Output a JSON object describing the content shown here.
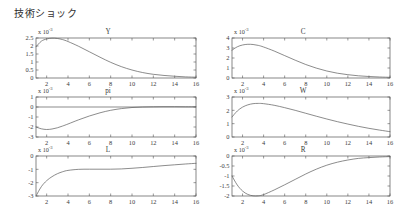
{
  "figure": {
    "title": "技術ショック",
    "width": 400,
    "height": 220,
    "line_color": "#5a5a5a",
    "axis_color": "#555555",
    "background": "#ffffff",
    "scale_annotation": "x 10",
    "scale_exponent": "-3"
  },
  "chart_data": [
    {
      "type": "line",
      "title": "Y",
      "xlabel": "",
      "ylabel": "",
      "xlim": [
        1,
        16
      ],
      "ylim": [
        0,
        2.5
      ],
      "yticks": [
        "0",
        "0.5",
        "1",
        "1.5",
        "2",
        "2.5"
      ],
      "ytick_values": [
        0,
        0.5,
        1,
        1.5,
        2,
        2.5
      ],
      "xticks": [
        "2",
        "4",
        "6",
        "8",
        "10",
        "12",
        "14",
        "16"
      ],
      "xtick_values": [
        2,
        4,
        6,
        8,
        10,
        12,
        14,
        16
      ],
      "scale": "x 10^-3",
      "grid": false,
      "legend": "none",
      "x": [
        1,
        1.5,
        2,
        2.5,
        3,
        3.5,
        4,
        5,
        6,
        7,
        8,
        9,
        10,
        11,
        12,
        13,
        14,
        15,
        16
      ],
      "values": [
        1.95,
        2.3,
        2.44,
        2.49,
        2.47,
        2.4,
        2.28,
        1.98,
        1.64,
        1.3,
        0.98,
        0.71,
        0.5,
        0.34,
        0.23,
        0.16,
        0.11,
        0.07,
        0.05
      ]
    },
    {
      "type": "line",
      "title": "C",
      "xlabel": "",
      "ylabel": "",
      "xlim": [
        1,
        16
      ],
      "ylim": [
        0,
        4
      ],
      "yticks": [
        "0",
        "1",
        "2",
        "3",
        "4"
      ],
      "ytick_values": [
        0,
        1,
        2,
        3,
        4
      ],
      "xticks": [
        "2",
        "4",
        "6",
        "8",
        "10",
        "12",
        "14",
        "16"
      ],
      "xtick_values": [
        2,
        4,
        6,
        8,
        10,
        12,
        14,
        16
      ],
      "scale": "x 10^-3",
      "grid": false,
      "legend": "none",
      "x": [
        1,
        1.5,
        2,
        2.5,
        3,
        3.5,
        4,
        5,
        6,
        7,
        8,
        9,
        10,
        11,
        12,
        13,
        14,
        15,
        16
      ],
      "values": [
        2.78,
        3.12,
        3.3,
        3.37,
        3.35,
        3.26,
        3.1,
        2.7,
        2.24,
        1.78,
        1.35,
        0.99,
        0.7,
        0.48,
        0.33,
        0.22,
        0.15,
        0.1,
        0.07
      ]
    },
    {
      "type": "line",
      "title": "pi",
      "xlabel": "",
      "ylabel": "",
      "xlim": [
        1,
        16
      ],
      "ylim": [
        -3,
        1
      ],
      "yticks": [
        "1",
        "0",
        "-1",
        "-2",
        "-3"
      ],
      "ytick_values": [
        1,
        0,
        -1,
        -2,
        -3
      ],
      "xticks": [
        "2",
        "4",
        "6",
        "8",
        "10",
        "12",
        "14",
        "16"
      ],
      "xtick_values": [
        2,
        4,
        6,
        8,
        10,
        12,
        14,
        16
      ],
      "scale": "x 10^-3",
      "grid": false,
      "legend": "none",
      "zero_line": true,
      "x": [
        1,
        1.5,
        2,
        2.5,
        3,
        3.5,
        4,
        5,
        6,
        7,
        8,
        9,
        10,
        11,
        12,
        13,
        14,
        15,
        16
      ],
      "values": [
        -2.0,
        -2.18,
        -2.25,
        -2.2,
        -2.08,
        -1.9,
        -1.7,
        -1.28,
        -0.9,
        -0.58,
        -0.33,
        -0.16,
        -0.05,
        0.0,
        0.02,
        0.03,
        0.03,
        0.02,
        0.02
      ]
    },
    {
      "type": "line",
      "title": "W",
      "xlabel": "",
      "ylabel": "",
      "xlim": [
        1,
        16
      ],
      "ylim": [
        0,
        3
      ],
      "yticks": [
        "0",
        "1",
        "2",
        "3"
      ],
      "ytick_values": [
        0,
        1,
        2,
        3
      ],
      "xticks": [
        "2",
        "4",
        "6",
        "8",
        "10",
        "12",
        "14",
        "16"
      ],
      "xtick_values": [
        2,
        4,
        6,
        8,
        10,
        12,
        14,
        16
      ],
      "scale": "x 10^-3",
      "grid": false,
      "legend": "none",
      "x": [
        1,
        1.5,
        2,
        2.5,
        3,
        3.5,
        4,
        5,
        6,
        7,
        8,
        9,
        10,
        11,
        12,
        13,
        14,
        15,
        16
      ],
      "values": [
        1.5,
        1.95,
        2.24,
        2.41,
        2.5,
        2.52,
        2.5,
        2.38,
        2.2,
        2.0,
        1.78,
        1.56,
        1.35,
        1.15,
        0.97,
        0.8,
        0.65,
        0.52,
        0.4
      ]
    },
    {
      "type": "line",
      "title": "L",
      "xlabel": "",
      "ylabel": "",
      "xlim": [
        1,
        16
      ],
      "ylim": [
        -3,
        0
      ],
      "yticks": [
        "0",
        "-1",
        "-2",
        "-3"
      ],
      "ytick_values": [
        0,
        -1,
        -2,
        -3
      ],
      "xticks": [
        "2",
        "4",
        "6",
        "8",
        "10",
        "12",
        "14",
        "16"
      ],
      "xtick_values": [
        2,
        4,
        6,
        8,
        10,
        12,
        14,
        16
      ],
      "scale": "x 10^-3",
      "grid": false,
      "legend": "none",
      "x": [
        1,
        1.5,
        2,
        2.5,
        3,
        3.5,
        4,
        5,
        6,
        7,
        8,
        9,
        10,
        11,
        12,
        13,
        14,
        15,
        16
      ],
      "values": [
        -3.0,
        -2.3,
        -1.85,
        -1.55,
        -1.33,
        -1.18,
        -1.08,
        -1.0,
        -0.99,
        -0.99,
        -0.99,
        -0.97,
        -0.92,
        -0.86,
        -0.79,
        -0.72,
        -0.66,
        -0.6,
        -0.55
      ]
    },
    {
      "type": "line",
      "title": "R",
      "xlabel": "",
      "ylabel": "",
      "xlim": [
        1,
        16
      ],
      "ylim": [
        -2,
        0
      ],
      "yticks": [
        "0",
        "-0.5",
        "-1",
        "-1.5",
        "-2"
      ],
      "ytick_values": [
        0,
        -0.5,
        -1,
        -1.5,
        -2
      ],
      "xticks": [
        "2",
        "4",
        "6",
        "8",
        "10",
        "12",
        "14",
        "16"
      ],
      "xtick_values": [
        2,
        4,
        6,
        8,
        10,
        12,
        14,
        16
      ],
      "scale": "x 10^-3",
      "grid": false,
      "legend": "none",
      "x": [
        1,
        1.5,
        2,
        2.5,
        3,
        3.5,
        4,
        5,
        6,
        7,
        8,
        9,
        10,
        11,
        12,
        13,
        14,
        15,
        16
      ],
      "values": [
        -1.0,
        -1.45,
        -1.75,
        -1.92,
        -1.99,
        -1.99,
        -1.93,
        -1.7,
        -1.44,
        -1.17,
        -0.9,
        -0.66,
        -0.46,
        -0.31,
        -0.2,
        -0.12,
        -0.08,
        -0.05,
        -0.03
      ]
    }
  ],
  "layout": {
    "panels": [
      {
        "key": "Y",
        "x": 36,
        "y": 38,
        "w": 160,
        "h": 40
      },
      {
        "key": "C",
        "x": 232,
        "y": 38,
        "w": 158,
        "h": 40
      },
      {
        "key": "pi",
        "x": 36,
        "y": 97,
        "w": 160,
        "h": 40
      },
      {
        "key": "W",
        "x": 232,
        "y": 97,
        "w": 158,
        "h": 40
      },
      {
        "key": "L",
        "x": 36,
        "y": 156,
        "w": 160,
        "h": 40
      },
      {
        "key": "R",
        "x": 232,
        "y": 156,
        "w": 158,
        "h": 40
      }
    ]
  }
}
